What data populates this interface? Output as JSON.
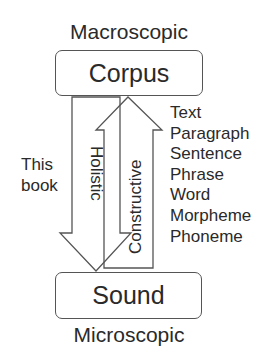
{
  "diagram": {
    "top_label": "Macroscopic",
    "bottom_label": "Microscopic",
    "top_box": "Corpus",
    "bottom_box": "Sound",
    "side_label": [
      "This",
      "book"
    ],
    "down_arrow_label": "Holistic",
    "up_arrow_label": "Constructive",
    "levels": [
      "Text",
      "Paragraph",
      "Sentence",
      "Phrase",
      "Word",
      "Morpheme",
      "Phoneme"
    ],
    "colors": {
      "stroke": "#555555",
      "text": "#2a2a2a",
      "background": "#ffffff"
    }
  }
}
